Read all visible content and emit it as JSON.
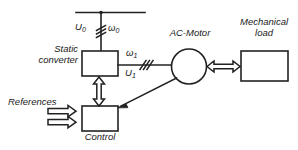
{
  "diagram": {
    "stroke_color": "#222222",
    "fill_color": "#ffffff",
    "background": "#ffffff",
    "blocks": [
      {
        "id": "static-converter",
        "label_line1": "Static",
        "label_line2": "converter",
        "shape": "rectangle"
      },
      {
        "id": "control",
        "label": "Control",
        "shape": "rectangle"
      },
      {
        "id": "ac-motor",
        "label": "AC-Motor",
        "shape": "circle"
      },
      {
        "id": "mechanical-load",
        "label_line1": "Mechanical",
        "label_line2": "load",
        "shape": "rectangle"
      }
    ],
    "signals": {
      "supply_voltage": "U",
      "supply_voltage_sub": "0",
      "supply_frequency": "ω",
      "supply_frequency_sub": "0",
      "output_frequency": "ω",
      "output_frequency_sub": "1",
      "output_voltage": "U",
      "output_voltage_sub": "1",
      "references": "References"
    },
    "connections": [
      {
        "from": "supply-bus",
        "to": "static-converter",
        "type": "three-phase-line",
        "slashes": 3
      },
      {
        "from": "static-converter",
        "to": "ac-motor",
        "type": "three-phase-line",
        "slashes": 3
      },
      {
        "from": "ac-motor",
        "to": "mechanical-load",
        "type": "double-arrow"
      },
      {
        "from": "static-converter",
        "to": "control",
        "type": "vertical-double-arrow"
      },
      {
        "from": "references",
        "to": "control",
        "type": "double-block-arrow"
      },
      {
        "from": "ac-motor",
        "to": "control",
        "type": "feedback-arrow"
      }
    ]
  }
}
